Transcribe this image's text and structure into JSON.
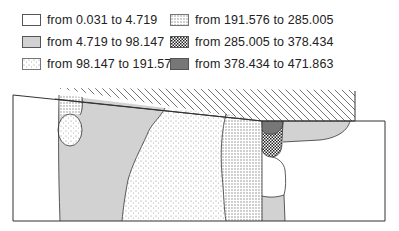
{
  "legend": {
    "items": [
      {
        "label": "from 0.031 to 4.719",
        "pattern": "white"
      },
      {
        "label": "from 4.719 to 98.147",
        "pattern": "gray-fine"
      },
      {
        "label": "from 98.147 to 191.576",
        "pattern": "sparse-dots"
      },
      {
        "label": "from 191.576 to 285.005",
        "pattern": "medium-dots"
      },
      {
        "label": "from 285.005 to 378.434",
        "pattern": "checker"
      },
      {
        "label": "from 378.434 to 471.863",
        "pattern": "dark-gray"
      }
    ]
  },
  "colors": {
    "outline": "#333333",
    "gray_fine": "#cfcfcf",
    "dark_gray": "#777777",
    "background": "#ffffff"
  }
}
